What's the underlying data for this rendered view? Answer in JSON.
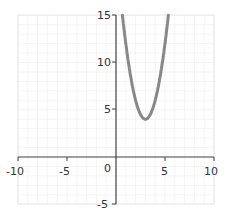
{
  "chart_data": {
    "type": "line",
    "title": "",
    "xlabel": "",
    "ylabel": "",
    "xlim": [
      -10,
      10
    ],
    "ylim": [
      -5,
      15
    ],
    "grid": true,
    "x_ticks": [
      "-10",
      "-5",
      "0",
      "5",
      "10"
    ],
    "y_ticks": [
      "-5",
      "5",
      "10",
      "15"
    ],
    "series": [
      {
        "name": "y = 2(x-3)^2 + 4",
        "color": "#888888",
        "x": [
          0.65,
          1,
          1.5,
          2,
          2.5,
          3,
          3.5,
          4,
          4.5,
          5,
          5.35
        ],
        "y": [
          15,
          12,
          8.5,
          6,
          4.5,
          4,
          4.5,
          6,
          8.5,
          12,
          15
        ]
      }
    ]
  },
  "labels": {
    "x_m10": "-10",
    "x_m5": "-5",
    "x0": "0",
    "x5": "5",
    "x10": "10",
    "y_m5": "-5",
    "y5": "5",
    "y10": "10",
    "y15": "15"
  }
}
